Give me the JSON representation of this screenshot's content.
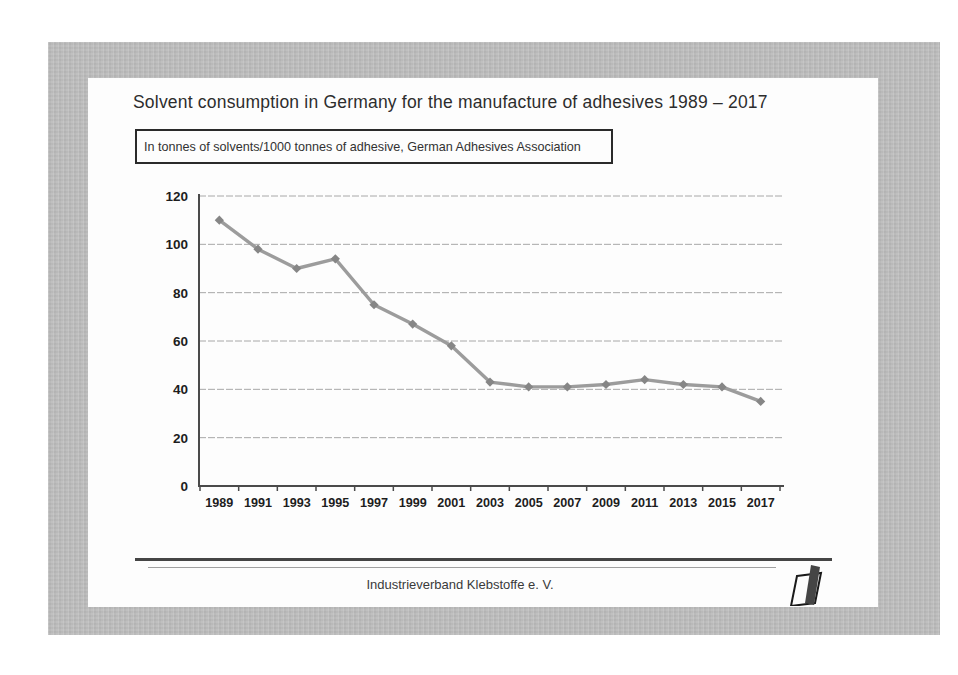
{
  "slide": {
    "title": "Solvent consumption in Germany for the manufacture of adhesives 1989 – 2017",
    "subtitle": "In tonnes of solvents/1000 tonnes of adhesive, German Adhesives Association",
    "footer": "Industrieverband Klebstoffe e. V.",
    "logo_name": "ivk-logo"
  },
  "chart_data": {
    "type": "line",
    "title": "Solvent consumption in Germany for the manufacture of adhesives 1989 – 2017",
    "subtitle": "In tonnes of solvents/1000 tonnes of adhesive, German Adhesives Association",
    "categories": [
      "1989",
      "1991",
      "1993",
      "1995",
      "1997",
      "1999",
      "2001",
      "2003",
      "2005",
      "2007",
      "2009",
      "2011",
      "2013",
      "2015",
      "2017"
    ],
    "series": [
      {
        "name": "Solvent consumption (tonnes of solvents per 1000 tonnes of adhesive)",
        "values": [
          110,
          98,
          90,
          94,
          75,
          67,
          58,
          43,
          41,
          41,
          42,
          44,
          42,
          41,
          35
        ]
      }
    ],
    "xlabel": "",
    "ylabel": "",
    "ylim": [
      0,
      120
    ],
    "ytick_interval": 20,
    "grid": true,
    "legend_position": "none",
    "marker": "diamond",
    "line_color": "#9c9c9c",
    "marker_color": "#868686",
    "gridline_color": "#a8a8a8",
    "axis_color": "#4a4a4a",
    "label_color": "#1d1d1d"
  },
  "colors": {
    "frame_gray": "#bdbdbd",
    "slide_white": "#fdfdfd",
    "logo_bar": "#454545",
    "logo_outline": "#1a1a1a"
  }
}
